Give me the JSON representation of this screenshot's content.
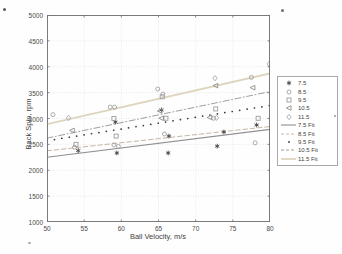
{
  "figure": {
    "xlabel": "Ball Velocity, m/s",
    "ylabel": "Back Spin, rpm"
  },
  "chart_data": {
    "type": "scatter",
    "title": "",
    "xlabel": "Ball Velocity, m/s",
    "ylabel": "Back Spin, rpm",
    "xlim": [
      50,
      80
    ],
    "ylim": [
      1000,
      5000
    ],
    "xticks": [
      50,
      55,
      60,
      65,
      70,
      75,
      80
    ],
    "yticks": [
      1000,
      1500,
      2000,
      2500,
      3000,
      3500,
      4000,
      4500,
      5000
    ],
    "grid": true,
    "legend_position": "right-outside",
    "legend": [
      "7.5",
      "8.5",
      "9.5",
      "10.5",
      "11.5",
      "7.5 Fit",
      "8.5 Fit",
      "9.5 Fit",
      "10.5 Fit",
      "11.5 Fit"
    ],
    "series": [
      {
        "name": "7.5",
        "marker": "asterisk",
        "color": "#3f3f3f",
        "points": [
          [
            54.2,
            2380
          ],
          [
            59.2,
            2930
          ],
          [
            59.4,
            2334
          ],
          [
            65.4,
            3165
          ],
          [
            66.4,
            2660
          ],
          [
            66.3,
            2334
          ],
          [
            72.9,
            2465
          ],
          [
            73.8,
            2740
          ],
          [
            78.2,
            2875
          ]
        ]
      },
      {
        "name": "8.5",
        "marker": "circle",
        "color": "#a2a2a2",
        "points": [
          [
            50.8,
            3075
          ],
          [
            53.7,
            2445
          ],
          [
            58.5,
            3220
          ],
          [
            59.1,
            3220
          ],
          [
            59.0,
            2490
          ],
          [
            59.6,
            2460
          ],
          [
            64.9,
            3570
          ],
          [
            65.6,
            3470
          ],
          [
            65.8,
            2700
          ],
          [
            72.4,
            3005
          ],
          [
            77.5,
            3795
          ],
          [
            78.0,
            2530
          ]
        ]
      },
      {
        "name": "9.5",
        "marker": "square",
        "color": "#9c9c9c",
        "points": [
          [
            53.9,
            2500
          ],
          [
            59.0,
            3000
          ],
          [
            59.3,
            2660
          ],
          [
            65.5,
            3420
          ],
          [
            66.0,
            3005
          ],
          [
            72.7,
            3185
          ],
          [
            78.4,
            3004
          ]
        ]
      },
      {
        "name": "10.5",
        "marker": "triangle-left",
        "color": "#8e8e8e",
        "points": [
          [
            53.4,
            2770
          ],
          [
            65.2,
            3145
          ],
          [
            65.4,
            3005
          ],
          [
            71.9,
            3020
          ],
          [
            72.7,
            3635
          ],
          [
            77.7,
            3595
          ]
        ]
      },
      {
        "name": "11.5",
        "marker": "diamond",
        "color": "#a8a8a8",
        "points": [
          [
            52.9,
            3010
          ],
          [
            72.6,
            3780
          ],
          [
            72.8,
            3015
          ],
          [
            79.9,
            4055
          ]
        ]
      }
    ],
    "fits": [
      {
        "name": "7.5 Fit",
        "style": "solid",
        "color": "#8f8f8f",
        "width": 1.1,
        "x": [
          50,
          80
        ],
        "y": [
          2250,
          2790
        ]
      },
      {
        "name": "8.5 Fit",
        "style": "dashed",
        "color": "#c5b7a5",
        "width": 1,
        "x": [
          50,
          80
        ],
        "y": [
          2375,
          2845
        ]
      },
      {
        "name": "9.5 Fit",
        "style": "dotted",
        "color": "#3d3d3d",
        "width": 1.7,
        "x": [
          50,
          80
        ],
        "y": [
          2570,
          3250
        ]
      },
      {
        "name": "10.5 Fit",
        "style": "dashdot",
        "color": "#9e9e9e",
        "width": 1,
        "x": [
          50,
          80
        ],
        "y": [
          2620,
          3520
        ]
      },
      {
        "name": "11.5 Fit",
        "style": "solid",
        "color": "#ddd5bd",
        "width": 1.8,
        "x": [
          50,
          80
        ],
        "y": [
          2890,
          3870
        ]
      }
    ]
  }
}
